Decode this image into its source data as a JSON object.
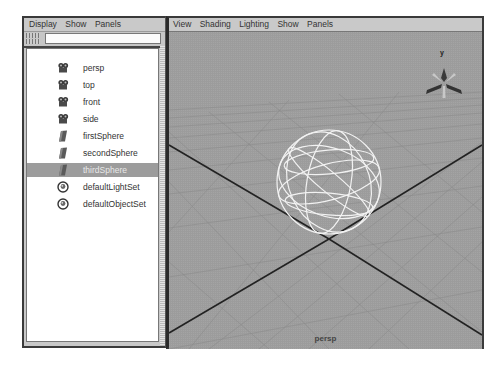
{
  "outliner": {
    "menu": [
      "Display",
      "Show",
      "Panels"
    ],
    "filter": {
      "value": "",
      "placeholder": ""
    },
    "items": [
      {
        "label": "persp",
        "icon": "camera-icon",
        "selected": false
      },
      {
        "label": "top",
        "icon": "camera-icon",
        "selected": false
      },
      {
        "label": "front",
        "icon": "camera-icon",
        "selected": false
      },
      {
        "label": "side",
        "icon": "camera-icon",
        "selected": false
      },
      {
        "label": "firstSphere",
        "icon": "transform-icon",
        "selected": false
      },
      {
        "label": "secondSphere",
        "icon": "transform-icon",
        "selected": false
      },
      {
        "label": "thirdSphere",
        "icon": "transform-icon",
        "selected": true
      },
      {
        "label": "defaultLightSet",
        "icon": "set-icon",
        "selected": false
      },
      {
        "label": "defaultObjectSet",
        "icon": "set-icon",
        "selected": false
      }
    ]
  },
  "viewport": {
    "menu": [
      "View",
      "Shading",
      "Lighting",
      "Show",
      "Panels"
    ],
    "camera_label": "persp",
    "axis_gizmo_label": "y",
    "colors": {
      "background": "#9a9a9a",
      "grid": "#8a8a8a",
      "axis_lines": "#222222",
      "wireframe": "#f0f0f0"
    }
  }
}
